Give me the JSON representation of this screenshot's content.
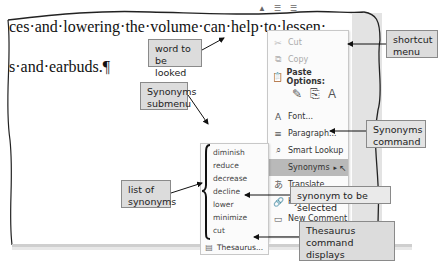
{
  "document": {
    "line1": "ces·and·lowering·the·volume·can·help·to·lessen·",
    "line2": "s·and·earbuds.¶"
  },
  "shortcut_menu": {
    "items": [
      {
        "label": "Cut",
        "icon": "scissors-icon",
        "enabled": false
      },
      {
        "label": "Copy",
        "icon": "copy-icon",
        "enabled": false
      },
      {
        "label": "Paste Options:",
        "icon": "paste-icon",
        "enabled": true,
        "bold": true
      },
      {
        "label": "Font...",
        "icon": "font-icon",
        "enabled": true
      },
      {
        "label": "Paragraph...",
        "icon": "paragraph-icon",
        "enabled": true
      },
      {
        "label": "Smart Lookup",
        "icon": "search-icon",
        "enabled": true
      },
      {
        "label": "Synonyms",
        "icon": "",
        "enabled": true,
        "highlighted": true,
        "submenu": true
      },
      {
        "label": "Translate",
        "icon": "translate-icon",
        "enabled": true
      },
      {
        "label": "Hyperlink...",
        "icon": "link-icon",
        "enabled": true
      },
      {
        "label": "New Comment",
        "icon": "comment-icon",
        "enabled": true
      }
    ]
  },
  "synonyms_submenu": {
    "items": [
      "diminish",
      "reduce",
      "decrease",
      "decline",
      "lower",
      "minimize",
      "cut",
      "slacken"
    ],
    "thesaurus_label": "Thesaurus..."
  },
  "callouts": {
    "word_lookup": "word to be looked up",
    "shortcut_menu": "shortcut menu",
    "synonyms_submenu": "Synonyms submenu",
    "synonyms_command": "Synonyms command",
    "list_of_synonyms": "list of synonyms",
    "synonym_selected": "synonym to be selected",
    "thesaurus_command": "Thesaurus command displays Thesaurus task pane"
  }
}
